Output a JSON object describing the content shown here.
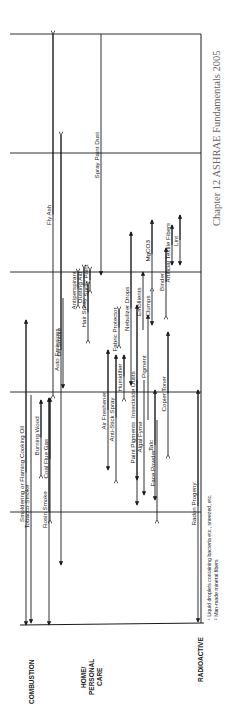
{
  "caption": "Chapter 12 ASHRAE Fundamentals 2005",
  "categories": [
    "COMBUSTION",
    "HOME/ PERSONAL CARE",
    "RADIOACTIVE"
  ],
  "footnotes": [
    "¹ Liquid droplets containing bacteria etc., sneezed, etc.",
    "² Man-made mineral fibers"
  ],
  "chart_data": {
    "type": "range",
    "orientation": "rotated 90° counter-clockwise (size axis runs bottom→top)",
    "gridlines_y_px": [
      34,
      153,
      272,
      392,
      512
    ],
    "axis_baseline_y_px": 625,
    "frame": {
      "left": 10,
      "right": 201,
      "top": 34,
      "bottom": 625
    },
    "groups": [
      {
        "category": "COMBUSTION",
        "items": [
          {
            "label": "Fly Ash",
            "x": 53,
            "from_y": 34,
            "to_y": 395,
            "start": "tail",
            "end": "tail"
          },
          {
            "label": "Auto Emissions",
            "x": 61,
            "from_y": 135,
            "to_y": 565,
            "start": "tail",
            "end": "arrow"
          },
          {
            "label": "Tobacco Smoke",
            "x": 31,
            "from_y": 395,
            "to_y": 623,
            "start": "none",
            "end": "arrow"
          },
          {
            "label": "Burning Wood",
            "x": 41,
            "from_y": 400,
            "to_y": 475,
            "start": "arrow",
            "end": "tail"
          },
          {
            "label": "Smoldering or Flaming Cooking Oil",
            "x": 26,
            "from_y": 320,
            "to_y": 625,
            "start": "arrow",
            "end": "arrow"
          },
          {
            "label": "Oil Smoke",
            "x": 63,
            "from_y": 298,
            "to_y": 388,
            "start": "none",
            "end": "arrow"
          },
          {
            "label": "Coal Flue Gas",
            "x": 50,
            "from_y": 398,
            "to_y": 520,
            "start": "arrow",
            "end": "tail"
          },
          {
            "label": "Rosin Smoke",
            "x": 49,
            "from_y": 398,
            "to_y": 625,
            "start": "arrow",
            "end": "arrow"
          }
        ]
      },
      {
        "category": "HOME/ PERSONAL CARE",
        "items": [
          {
            "label": "Spray Paint Dust",
            "x": 101,
            "from_y": 34,
            "to_y": 275,
            "start": "none",
            "end": "arrow"
          },
          {
            "label": "Antiperspirant",
            "x": 78,
            "from_y": 272,
            "to_y": 305,
            "start": "tail",
            "end": "tail"
          },
          {
            "label": "Dusting Aid",
            "x": 84,
            "from_y": 268,
            "to_y": 305,
            "start": "tail",
            "end": "tail"
          },
          {
            "label": "Spray Paint",
            "x": 90,
            "from_y": 270,
            "to_y": 290,
            "start": "tail",
            "end": "tail"
          },
          {
            "label": "Hair Spray",
            "x": 88,
            "from_y": 285,
            "to_y": 340,
            "start": "tail",
            "end": "tail"
          },
          {
            "label": "Fabric Protector",
            "x": 119,
            "from_y": 310,
            "to_y": 345,
            "start": "tail",
            "end": "tail"
          },
          {
            "label": "Nebulizer Drops",
            "x": 131,
            "from_y": 232,
            "to_y": 385,
            "start": "arrow",
            "end": "arrow"
          },
          {
            "label": "Emollients",
            "x": 143,
            "from_y": 272,
            "to_y": 330,
            "start": "arrow",
            "end": "none"
          },
          {
            "label": "MgCO3",
            "x": 152,
            "from_y": 220,
            "to_y": 288,
            "start": "arrow",
            "end": "tail"
          },
          {
            "label": "Clumps",
            "x": 152,
            "from_y": 290,
            "to_y": 325,
            "start": "none",
            "end": "arrow"
          },
          {
            "label": "Binder",
            "x": 166,
            "from_y": 248,
            "to_y": 316,
            "start": "arrow",
            "end": "tail"
          },
          {
            "label": "Artificial Textile Fibers",
            "x": 172,
            "from_y": 225,
            "to_y": 265,
            "start": "arrow",
            "end": "arrow"
          },
          {
            "label": "Lint",
            "x": 180,
            "from_y": 215,
            "to_y": 265,
            "start": "arrow",
            "end": "arrow"
          },
          {
            "label": "Air Freshener",
            "x": 108,
            "from_y": 350,
            "to_y": 470,
            "start": "arrow",
            "end": "arrow"
          },
          {
            "label": "Anti-Stick Spray",
            "x": 116,
            "from_y": 355,
            "to_y": 480,
            "start": "arrow",
            "end": "tail"
          },
          {
            "label": "Humidifier",
            "x": 124,
            "from_y": 355,
            "to_y": 398,
            "start": "arrow",
            "end": "tail"
          },
          {
            "label": "Insecticide Dusts",
            "x": 137,
            "from_y": 305,
            "to_y": 480,
            "start": "arrow",
            "end": "arrow"
          },
          {
            "label": "Paint Pigments",
            "x": 137,
            "from_y": 380,
            "to_y": 505,
            "start": "none",
            "end": "arrow"
          },
          {
            "label": "Algal Fyme",
            "x": 144,
            "from_y": 380,
            "to_y": 495,
            "start": "none",
            "end": "arrow"
          },
          {
            "label": "Pigment",
            "x": 148,
            "from_y": 315,
            "to_y": 420,
            "start": "arrow",
            "end": "none"
          },
          {
            "label": "Talc",
            "x": 155,
            "from_y": 390,
            "to_y": 500,
            "start": "arrow",
            "end": "arrow"
          },
          {
            "label": "Copier Toner",
            "x": 168,
            "from_y": 332,
            "to_y": 455,
            "start": "arrow",
            "end": "tail"
          },
          {
            "label": "Face Powder",
            "x": 157,
            "from_y": 420,
            "to_y": 520,
            "start": "none",
            "end": "tail"
          }
        ]
      },
      {
        "category": "RADIOACTIVE",
        "items": [
          {
            "label": "Radon Progeny",
            "x": 198,
            "from_y": 390,
            "to_y": 622,
            "start": "arrow",
            "end": "arrow"
          }
        ]
      }
    ]
  }
}
